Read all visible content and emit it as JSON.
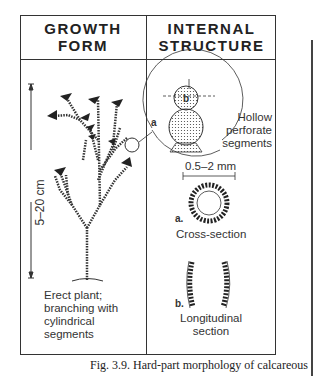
{
  "headers": {
    "left": [
      "GROWTH",
      "FORM"
    ],
    "right": [
      "INTERNAL",
      "STRUCTURE"
    ]
  },
  "scale_label": "5–20 cm",
  "growth_description": [
    "Erect plant;",
    "branching with",
    "cylindrical",
    "segments"
  ],
  "inset_labels": {
    "a": "a",
    "b": "b",
    "hollow": [
      "Hollow",
      "perforate",
      "segments"
    ]
  },
  "cross_section": {
    "dimension": "0.5–2 mm",
    "marker": "a.",
    "label": "Cross-section"
  },
  "longitudinal_section": {
    "marker": "b.",
    "label": [
      "Longitudinal",
      "section"
    ]
  },
  "caption": "Fig. 3.9.  Hard-part morphology of calcareous alga"
}
